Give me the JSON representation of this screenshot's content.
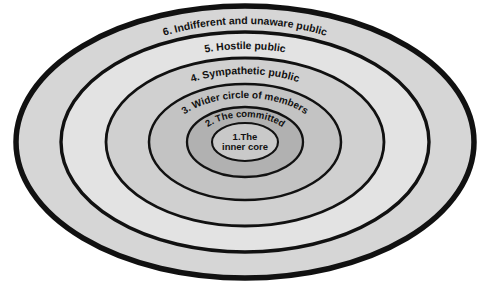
{
  "diagram": {
    "type": "concentric-ellipses",
    "shape": "ellipse",
    "background_color": "#ffffff",
    "outline_color": "#111111",
    "rings": [
      {
        "number": "6.",
        "label": "6. Indifferent and unaware public",
        "name": "Indifferent and unaware public",
        "fill_color": "#d4d4d4",
        "stroke_width": 5,
        "rx": 229,
        "ry": 136,
        "label_font_size": 10.5,
        "label_arc_ry_offset": 118
      },
      {
        "number": "5.",
        "label": "5. Hostile public",
        "name": "Hostile public",
        "fill_color": "#e0e0e0",
        "stroke_width": 3.2,
        "rx": 184,
        "ry": 110,
        "label_font_size": 10,
        "label_arc_ry_offset": 93
      },
      {
        "number": "4.",
        "label": "4. Sympathetic public",
        "name": "Sympathetic public",
        "fill_color": "#cfcfcf",
        "stroke_width": 2.6,
        "rx": 139,
        "ry": 84,
        "label_font_size": 10,
        "label_arc_ry_offset": 68
      },
      {
        "number": "3.",
        "label": "3. Wider circle of members",
        "name": "Wider circle of members",
        "fill_color": "#c2c2c2",
        "stroke_width": 2.4,
        "rx": 96,
        "ry": 58,
        "label_font_size": 10,
        "label_arc_ry_offset": 43
      },
      {
        "number": "2.",
        "label": "2. The committed",
        "name": "The committed",
        "fill_color": "#b0b0b0",
        "stroke_width": 2.2,
        "rx": 58,
        "ry": 35,
        "label_font_size": 9.5,
        "label_arc_ry_offset": 23
      },
      {
        "number": "1.",
        "label": "1.The inner core",
        "name": "The inner core",
        "label_line_1": "1.The",
        "label_line_2": "inner core",
        "fill_color": "#c8c8c8",
        "stroke_width": 2,
        "rx": 33,
        "ry": 19,
        "label_font_size": 9.5
      }
    ],
    "center": {
      "cx": 245,
      "cy": 142
    }
  }
}
